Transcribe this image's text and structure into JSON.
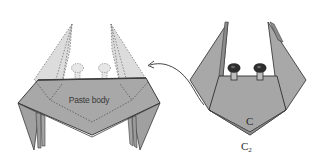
{
  "diagram": {
    "title": "",
    "left_figure": {
      "name": "crab-assembly-step",
      "label": "Paste body"
    },
    "right_figure": {
      "name": "crab-body-folded",
      "labels": {
        "point_c": "C",
        "point_c2": "C",
        "point_c2_subscript": "2"
      }
    },
    "arrow": {
      "direction": "right-to-left",
      "meaning": "move folded body onto assembly"
    },
    "colors": {
      "paper_dark": "#a6a6a6",
      "paper_light": "#d6d6d6",
      "outline": "#3c3c3c",
      "eye_dark": "#2e2e2e",
      "background": "#ffffff"
    }
  }
}
